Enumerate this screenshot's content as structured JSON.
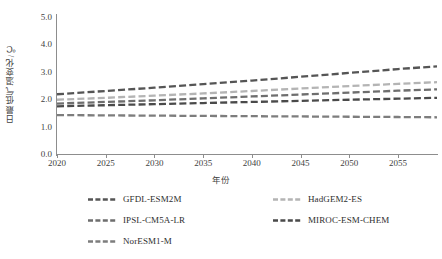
{
  "chart_data": {
    "type": "line",
    "title": "",
    "xlabel": "年份",
    "ylabel": "日最低气温变化/℃",
    "xlim": [
      2020,
      2059
    ],
    "ylim": [
      0.0,
      5.0
    ],
    "grid": false,
    "legend_position": "bottom",
    "x_ticks": [
      2020,
      2025,
      2030,
      2035,
      2040,
      2045,
      2050,
      2055
    ],
    "y_ticks": [
      "0.0",
      "1.0",
      "2.0",
      "3.0",
      "4.0",
      "5.0"
    ],
    "x": [
      2020,
      2025,
      2030,
      2035,
      2040,
      2045,
      2050,
      2055,
      2059
    ],
    "series": [
      {
        "name": "GFDL-ESM2M",
        "color": "#555555",
        "values": [
          2.18,
          2.3,
          2.42,
          2.55,
          2.68,
          2.82,
          2.96,
          3.1,
          3.2
        ]
      },
      {
        "name": "HadGEM2-ES",
        "color": "#b4b4b4",
        "values": [
          1.98,
          2.05,
          2.13,
          2.21,
          2.3,
          2.39,
          2.48,
          2.56,
          2.62
        ]
      },
      {
        "name": "IPSL-CM5A-LR",
        "color": "#6e6e6e",
        "values": [
          1.84,
          1.9,
          1.96,
          2.03,
          2.1,
          2.17,
          2.24,
          2.31,
          2.36
        ]
      },
      {
        "name": "MIROC-ESM-CHEM",
        "color": "#4a4a4a",
        "values": [
          1.74,
          1.78,
          1.82,
          1.86,
          1.9,
          1.94,
          1.98,
          2.02,
          2.05
        ]
      },
      {
        "name": "NorESM1-M",
        "color": "#7d7d7d",
        "values": [
          1.42,
          1.41,
          1.4,
          1.39,
          1.38,
          1.37,
          1.36,
          1.35,
          1.34
        ]
      }
    ]
  },
  "axes": {
    "y_title": "日最低气温变化/℃",
    "x_title": "年份",
    "axis_color": "#8d8d8d"
  },
  "legend": {
    "entries": [
      {
        "label": "GFDL-ESM2M",
        "color": "#555555",
        "col": 0,
        "row": 0
      },
      {
        "label": "HadGEM2-ES",
        "color": "#b4b4b4",
        "col": 1,
        "row": 0
      },
      {
        "label": "IPSL-CM5A-LR",
        "color": "#6e6e6e",
        "col": 0,
        "row": 1
      },
      {
        "label": "MIROC-ESM-CHEM",
        "color": "#4a4a4a",
        "col": 1,
        "row": 1
      },
      {
        "label": "NorESM1-M",
        "color": "#7d7d7d",
        "col": 0,
        "row": 2
      }
    ]
  }
}
